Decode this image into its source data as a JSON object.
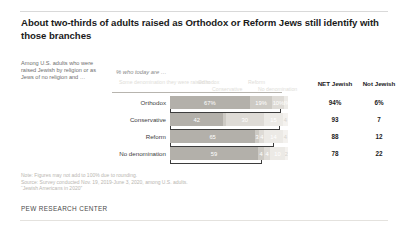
{
  "title": "About two-thirds of adults raised as Orthodox or Reform Jews still identify with those branches",
  "subcaption": "Among U.S. adults who were raised Jewish by religion or as Jews of no religion and …",
  "percent_label": "% who today are …",
  "column_headers": {
    "same_denomination": "Some denomination they were raised in",
    "orthodox": "Orthodox",
    "conservative": "Conservative",
    "reform": "Reform",
    "no_denomination": "No denomination",
    "net_jewish": "NET Jewish",
    "not_jewish": "Not Jewish"
  },
  "notes": {
    "note": "Note: Figures may not add to 100% due to rounding.",
    "source": "Source: Survey conducted Nov. 19, 2019-June 3, 2020, among U.S. adults.",
    "report": "“Jewish Americans in 2020”"
  },
  "footer": "PEW RESEARCH CENTER",
  "colors": {
    "bar_primary": "#b3b0aa",
    "bar_2": "#cdcac4",
    "bar_3": "#dedbd6",
    "bar_4": "#eceae6",
    "bar_5": "#f4f2ef",
    "text": "#1a1a1a",
    "muted": "#b9b6b1"
  },
  "chart_data": {
    "type": "bar",
    "title": "About two-thirds of adults raised as Orthodox or Reform Jews still identify with those branches",
    "subtitle": "% who today are …",
    "xlabel": "",
    "ylabel": "",
    "xlim": [
      0,
      100
    ],
    "grid": false,
    "legend": "top",
    "stacked": true,
    "categories": [
      "Orthodox",
      "Conservative",
      "Reform",
      "No denomination"
    ],
    "series": [
      {
        "name": "Same denomination they were raised in",
        "values": [
          67,
          42,
          65,
          59
        ]
      },
      {
        "name": "Orthodox",
        "values": [
          null,
          2,
          3,
          4
        ]
      },
      {
        "name": "Conservative",
        "values": [
          19,
          30,
          4,
          4
        ]
      },
      {
        "name": "Reform",
        "values": [
          10,
          15,
          14,
          10
        ]
      },
      {
        "name": "No denomination",
        "values": [
          3,
          4,
          4,
          2
        ]
      }
    ],
    "rows": [
      {
        "label": "Orthodox",
        "segments": [
          {
            "key": "same",
            "value": 67,
            "display": "67%"
          },
          {
            "key": "conservative",
            "value": 19,
            "display": "19%"
          },
          {
            "key": "reform",
            "value": 10,
            "display": "10%"
          },
          {
            "key": "no_denomination",
            "value": 3,
            "display": "3%"
          }
        ],
        "net_jewish": "94%",
        "not_jewish": "6%"
      },
      {
        "label": "Conservative",
        "segments": [
          {
            "key": "same",
            "value": 42,
            "display": "42"
          },
          {
            "key": "orthodox",
            "value": 2,
            "display": ""
          },
          {
            "key": "conservative",
            "value": 30,
            "display": "30"
          },
          {
            "key": "reform",
            "value": 15,
            "display": "15"
          },
          {
            "key": "no_denomination",
            "value": 4,
            "display": "4"
          }
        ],
        "net_jewish": "93",
        "not_jewish": "7"
      },
      {
        "label": "Reform",
        "segments": [
          {
            "key": "same",
            "value": 65,
            "display": "65"
          },
          {
            "key": "orthodox",
            "value": 3,
            "display": "3"
          },
          {
            "key": "conservative",
            "value": 4,
            "display": "4"
          },
          {
            "key": "reform",
            "value": 14,
            "display": "14"
          },
          {
            "key": "no_denomination",
            "value": 4,
            "display": "4"
          }
        ],
        "net_jewish": "88",
        "not_jewish": "12"
      },
      {
        "label": "No denomination",
        "segments": [
          {
            "key": "same",
            "value": 59,
            "display": "59"
          },
          {
            "key": "orthodox",
            "value": 4,
            "display": "4"
          },
          {
            "key": "conservative",
            "value": 4,
            "display": "4"
          },
          {
            "key": "reform",
            "value": 10,
            "display": "10"
          },
          {
            "key": "no_denomination",
            "value": 2,
            "display": "2"
          }
        ],
        "net_jewish": "78",
        "not_jewish": "22"
      }
    ]
  }
}
